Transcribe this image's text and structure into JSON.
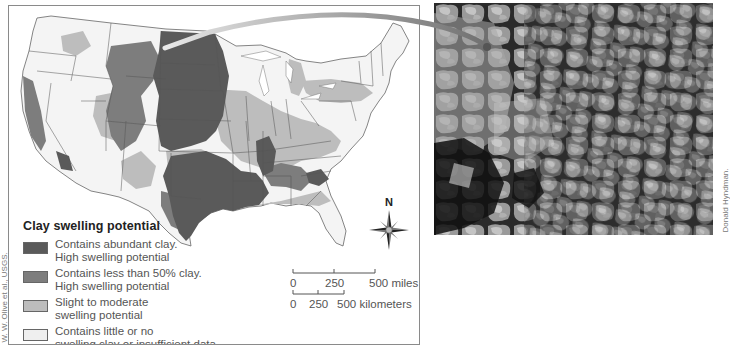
{
  "figure": {
    "type": "thematic-map-with-photo",
    "map_region": "Contiguous United States",
    "photo_subject": "Cracked, swelling clay soil surface (aerial/close view)"
  },
  "legend": {
    "title": "Clay swelling potential",
    "items": [
      {
        "label": "Contains abundant clay.\nHigh swelling potential",
        "color": "#5a5a5a"
      },
      {
        "label": "Contains less than 50% clay.\nHigh swelling potential",
        "color": "#7d7d7d"
      },
      {
        "label": "Slight to moderate\nswelling potential",
        "color": "#bdbdbd"
      },
      {
        "label": "Contains little or no\nswelling clay or insufficient data",
        "color": "#efefef"
      }
    ]
  },
  "compass": {
    "north_label": "N"
  },
  "scale": {
    "miles": {
      "ticks": [
        "0",
        "250",
        "500 miles"
      ]
    },
    "kilometers": {
      "ticks": [
        "0",
        "250",
        "500 kilometers"
      ]
    }
  },
  "credits": {
    "map": "W. W. Olive et al., USGS.",
    "photo": "Donald Hyndman."
  },
  "colors": {
    "abundant_clay": "#5a5a5a",
    "less_than_50": "#7d7d7d",
    "slight_moderate": "#bdbdbd",
    "little_none": "#efefef",
    "state_lines": "#555555",
    "frame": "#8a8a8a",
    "arrow": "#8c8c8c"
  }
}
